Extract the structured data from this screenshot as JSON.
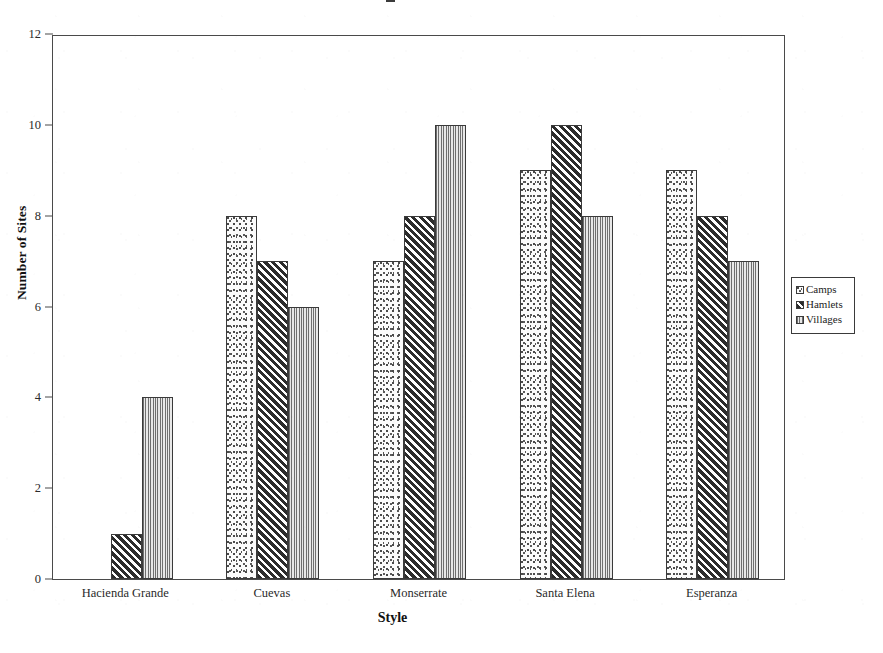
{
  "chart_data": {
    "type": "bar",
    "title": "",
    "xlabel": "Style",
    "ylabel": "Number of Sites",
    "categories": [
      "Hacienda Grande",
      "Cuevas",
      "Monserrate",
      "Santa Elena",
      "Esperanza"
    ],
    "series": [
      {
        "name": "Camps",
        "values": [
          0,
          8,
          7,
          9,
          9
        ],
        "pattern": "stipple-dots",
        "color": "#fbfbfb"
      },
      {
        "name": "Hamlets",
        "values": [
          1,
          7,
          8,
          10,
          8
        ],
        "pattern": "diagonal-hatch",
        "color": "#2c2c2c"
      },
      {
        "name": "Villages",
        "values": [
          4,
          6,
          10,
          8,
          7
        ],
        "pattern": "vertical-lines",
        "color": "#6f6f6f"
      }
    ],
    "ylim": [
      0,
      12
    ],
    "yticks": [
      0,
      2,
      4,
      6,
      8,
      10,
      12
    ],
    "ytick_labels": [
      "0",
      "2",
      "4",
      "6",
      "8",
      "10",
      "12"
    ],
    "grid": false,
    "legend_position": "right-outside",
    "frame": "box",
    "bar_group_gap": true
  },
  "legend": {
    "items": [
      {
        "label": "Camps"
      },
      {
        "label": "Hamlets"
      },
      {
        "label": "Villages"
      }
    ]
  },
  "axes": {
    "y_title": "Number of Sites",
    "x_title": "Style"
  }
}
